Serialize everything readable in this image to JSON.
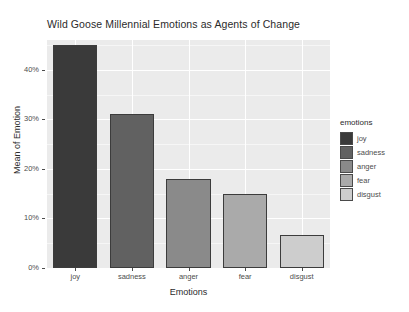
{
  "chart_data": {
    "type": "bar",
    "title": "Wild Goose Millennial Emotions as Agents of Change",
    "xlabel": "Emotions",
    "ylabel": "Mean of Emotion",
    "categories": [
      "joy",
      "sadness",
      "anger",
      "fear",
      "disgust"
    ],
    "values": [
      45,
      31,
      18,
      15,
      6.7
    ],
    "value_labels": [
      "45%",
      "31%",
      "18%",
      "15%",
      "6.7%"
    ],
    "ytick_labels": [
      "0%",
      "10%",
      "20%",
      "30%",
      "40%"
    ],
    "ytick_values": [
      0,
      10,
      20,
      30,
      40
    ],
    "ylim": [
      0,
      46
    ],
    "grid": true,
    "legend_position": "right",
    "legend": {
      "title": "emotions",
      "entries": [
        {
          "label": "joy",
          "color": "#3a3a3a"
        },
        {
          "label": "sadness",
          "color": "#616161"
        },
        {
          "label": "anger",
          "color": "#8a8a8a"
        },
        {
          "label": "fear",
          "color": "#aaaaaa"
        },
        {
          "label": "disgust",
          "color": "#cdcdcd"
        }
      ]
    },
    "series": [
      {
        "name": "emotions",
        "values": [
          45,
          31,
          18,
          15,
          6.7
        ],
        "colors": [
          "#3a3a3a",
          "#616161",
          "#8a8a8a",
          "#aaaaaa",
          "#cdcdcd"
        ]
      }
    ]
  },
  "panel": {
    "background_color": "#ebebeb",
    "gridline_color": "#ffffff"
  }
}
